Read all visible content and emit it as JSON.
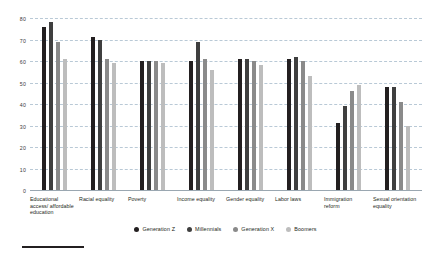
{
  "chart_data": {
    "type": "bar",
    "title": "",
    "xlabel": "",
    "ylabel": "",
    "ylim": [
      0,
      80
    ],
    "yticks": [
      0,
      10,
      20,
      30,
      40,
      50,
      60,
      70,
      80
    ],
    "grid": true,
    "legend_position": "bottom",
    "categories": [
      "Educational access/ affordable education",
      "Racial equality",
      "Poverty",
      "Income equality",
      "Gender equality",
      "Labor laws",
      "Immigration reform",
      "Sexual orientation equality"
    ],
    "series": [
      {
        "name": "Generation Z",
        "color": "#231f20",
        "values": [
          76,
          71,
          60,
          60,
          61,
          61,
          31,
          48
        ]
      },
      {
        "name": "Millennials",
        "color": "#3f3f3f",
        "values": [
          78,
          70,
          60,
          69,
          61,
          62,
          39,
          48
        ]
      },
      {
        "name": "Generation X",
        "color": "#8a8a8a",
        "values": [
          69,
          61,
          60,
          61,
          60,
          60,
          46,
          41
        ]
      },
      {
        "name": "Boomers",
        "color": "#bdbdbd",
        "values": [
          61,
          59,
          59,
          56,
          58,
          53,
          49,
          30
        ]
      }
    ]
  },
  "legend": {
    "items": [
      {
        "label": "Generation Z"
      },
      {
        "label": "Millennials"
      },
      {
        "label": "Generation X"
      },
      {
        "label": "Boomers"
      }
    ]
  }
}
